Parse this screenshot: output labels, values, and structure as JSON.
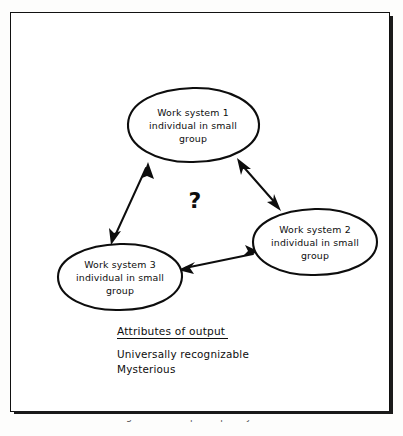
{
  "figure": {
    "caption": "Figure 7.1  The participatory model",
    "question_mark": "?"
  },
  "nodes": [
    {
      "id": "work-system-1",
      "lines": [
        "Work system 1",
        "individual in small",
        "group"
      ],
      "cx": 183,
      "cy": 113,
      "rx": 65,
      "ry": 37
    },
    {
      "id": "work-system-2",
      "lines": [
        "Work system 2",
        "individual in small",
        "group"
      ],
      "cx": 305,
      "cy": 230,
      "rx": 62,
      "ry": 33
    },
    {
      "id": "work-system-3",
      "lines": [
        "Work system 3",
        "individual in small",
        "group"
      ],
      "cx": 110,
      "cy": 265,
      "rx": 62,
      "ry": 33
    }
  ],
  "connections": [
    {
      "id": "link-1-3",
      "from": "work-system-1",
      "to": "work-system-3",
      "bidirectional": true
    },
    {
      "id": "link-1-2",
      "from": "work-system-1",
      "to": "work-system-2",
      "bidirectional": true
    },
    {
      "id": "link-3-2",
      "from": "work-system-3",
      "to": "work-system-2",
      "bidirectional": true
    }
  ],
  "attributes_block": {
    "heading": "Attributes of output",
    "items": [
      "Universally recognizable",
      "Mysterious"
    ]
  },
  "colors": {
    "ink": "#0d0d0d",
    "page": "#ffffff",
    "frame": "#111111"
  }
}
